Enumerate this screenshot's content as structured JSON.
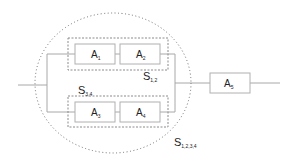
{
  "diagram": {
    "type": "reliability-block-diagram",
    "colors": {
      "line": "#a8a8a8",
      "box_border": "#b0b0b0",
      "dashed": "#8a8a8a",
      "dotted": "#6f6f6f",
      "text": "#222222"
    },
    "blocks": [
      {
        "id": "A1",
        "main": "A",
        "sub": "1"
      },
      {
        "id": "A2",
        "main": "A",
        "sub": "2"
      },
      {
        "id": "A3",
        "main": "A",
        "sub": "3"
      },
      {
        "id": "A4",
        "main": "A",
        "sub": "4"
      },
      {
        "id": "A5",
        "main": "A",
        "sub": "5"
      }
    ],
    "subsystems": [
      {
        "id": "S12",
        "main": "S",
        "sub": "1,2",
        "contains": [
          "A1",
          "A2"
        ],
        "style": "dashed-rectangle"
      },
      {
        "id": "S34",
        "main": "S",
        "sub": "3,4",
        "contains": [
          "A3",
          "A4"
        ],
        "style": "dashed-rectangle"
      },
      {
        "id": "S1234",
        "main": "S",
        "sub": "1,2,3,4",
        "contains": [
          "S12",
          "S34"
        ],
        "style": "dotted-ellipse"
      }
    ]
  }
}
